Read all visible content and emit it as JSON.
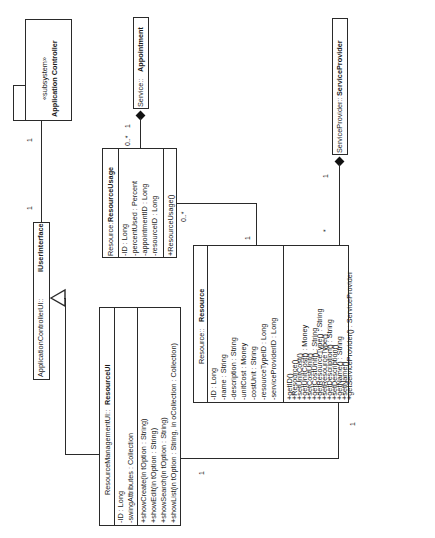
{
  "diagram": {
    "type": "uml-class-diagram",
    "orientation": "rotated-90-ccw",
    "classes": {
      "app_controller": {
        "stereotype": "«subsystem»",
        "name": "Application Controller"
      },
      "iuserinterface": {
        "package": "ApplicationControllerUI::",
        "name": "IUserInterface"
      },
      "appointment": {
        "package": "Service::",
        "name": "Appointment"
      },
      "service_provider": {
        "package": "ServiceProvider::",
        "name": "ServiceProvider"
      },
      "resource_usage": {
        "package": "Resource::",
        "name": "ResourceUsage",
        "attributes": [
          "-ID : Long",
          "-percentUsed : Percent",
          "-appointmentID : Long",
          "-resourceID : Long"
        ],
        "operations": [
          "+ResourceUsage()"
        ]
      },
      "resource_ui": {
        "package": "ResourceManagementUI::",
        "name": "ResourceUI",
        "attributes": [
          "-ID : Long",
          "-swingAttributes : Collection"
        ],
        "operations": [
          "+showCreate(in tOption : String)",
          "+showEdit(in tOption : String)",
          "+showSearch(in tOption : String)",
          "+showList(in tOption : String, in oCollection : Collection)"
        ]
      },
      "resource": {
        "package": "Resource::",
        "name": "Resource",
        "attributes": [
          "-ID : Long",
          "-name : String",
          "-description : String",
          "-unitCost : Money",
          "-costUnit : String",
          "-resourceTypeID : Long",
          "-serviceProviderID : Long"
        ],
        "operations": [
          "+getID()",
          "+Resource()",
          "+setUnitCost()",
          "+getUnitCost() : Money",
          "+setCostUnit()",
          "+getCostUnit() : String",
          "+getResourceType() : String",
          "+setResourceType()",
          "+getDescription() : String",
          "+setDescription()",
          "+getName() : String",
          "+setName()",
          "+getServiceProvider() : ServiceProvider"
        ]
      }
    },
    "multiplicities": {
      "controller_ui_a": "1",
      "controller_ui_b": "1",
      "appointment_end": "1",
      "usage_end_appt": "0..*",
      "usage_end_res": "0..*",
      "resource_end_usage": "1",
      "sp_end": "1",
      "resource_end_sp": "*",
      "resource_end_ui": "1",
      "ui_end_resource": "1"
    }
  }
}
